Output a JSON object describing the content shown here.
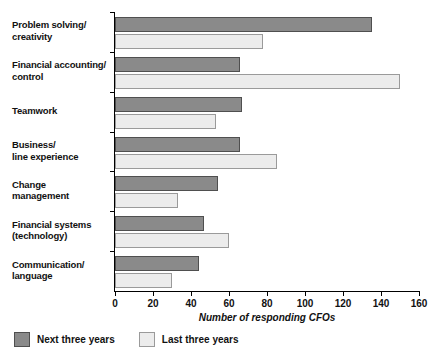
{
  "chart_data": {
    "type": "bar",
    "orientation": "horizontal",
    "title": "",
    "xlabel": "Number of responding CFOs",
    "ylabel": "",
    "xlim": [
      0,
      160
    ],
    "xticks": [
      0,
      20,
      40,
      60,
      80,
      100,
      120,
      140,
      160
    ],
    "grid": false,
    "legend_position": "bottom-left",
    "categories": [
      "Problem solving/\ncreativity",
      "Financial accounting/\ncontrol",
      "Teamwork",
      "Business/\nline experience",
      "Change\nmanagement",
      "Financial systems\n(technology)",
      "Communication/\nlanguage"
    ],
    "series": [
      {
        "name": "Next three years",
        "color": "#8a8a8a",
        "values": [
          135,
          66,
          67,
          66,
          54,
          47,
          44
        ]
      },
      {
        "name": "Last three years",
        "color": "#ececec",
        "values": [
          78,
          150,
          53,
          85,
          33,
          60,
          30
        ]
      }
    ]
  },
  "legend": {
    "items": [
      {
        "label": "Next three years",
        "swatch": "next"
      },
      {
        "label": "Last three years",
        "swatch": "last"
      }
    ]
  }
}
